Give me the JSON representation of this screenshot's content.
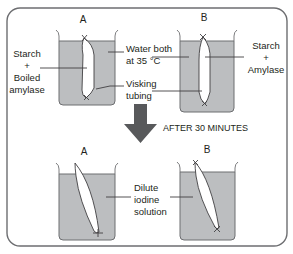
{
  "diagram": {
    "title_arrow": "AFTER 30 MINUTES",
    "before": {
      "beaker_a": {
        "label": "A",
        "contents": [
          "Starch",
          "+",
          "Boiled",
          "amylase"
        ]
      },
      "beaker_b": {
        "label": "B",
        "contents": [
          "Starch",
          "+",
          "Amylase"
        ]
      },
      "annotations": {
        "water": [
          "Water both",
          "at 35 °C"
        ],
        "tubing": [
          "Visking",
          "tubing"
        ]
      }
    },
    "after": {
      "beaker_a": {
        "label": "A"
      },
      "beaker_b": {
        "label": "B"
      },
      "annotations": {
        "iodine": [
          "Dilute",
          "iodine",
          "solution"
        ]
      }
    },
    "colors": {
      "liquid": "#bcbec0",
      "arrow": "#58595b",
      "frame": "#6d6e71"
    }
  }
}
